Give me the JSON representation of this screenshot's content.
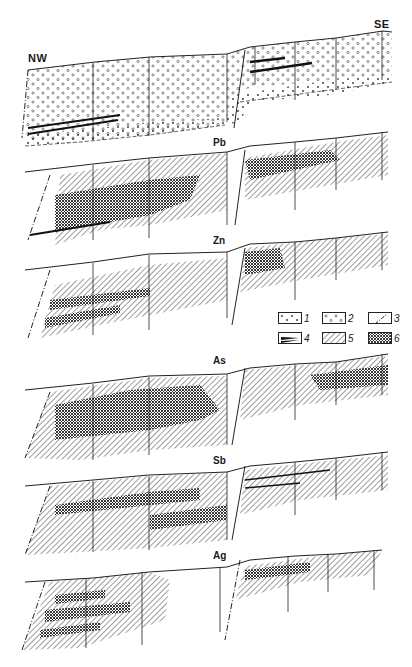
{
  "orientation": {
    "left": "NW",
    "right": "SE"
  },
  "panels": [
    {
      "id": "geology",
      "label": ""
    },
    {
      "id": "pb",
      "label": "Pb"
    },
    {
      "id": "zn",
      "label": "Zn"
    },
    {
      "id": "as",
      "label": "As"
    },
    {
      "id": "sb",
      "label": "Sb"
    },
    {
      "id": "ag",
      "label": "Ag"
    }
  ],
  "legend": {
    "items": [
      {
        "num": "1",
        "pattern": "crosses"
      },
      {
        "num": "2",
        "pattern": "circles"
      },
      {
        "num": "3",
        "pattern": "fault-line"
      },
      {
        "num": "4",
        "pattern": "thick-black-bands"
      },
      {
        "num": "5",
        "pattern": "diagonal-hatching"
      },
      {
        "num": "6",
        "pattern": "dense-crosshatch"
      }
    ]
  },
  "colors": {
    "ink": "#1a1a1a",
    "paper": "#ffffff",
    "stipple": "#555555"
  }
}
